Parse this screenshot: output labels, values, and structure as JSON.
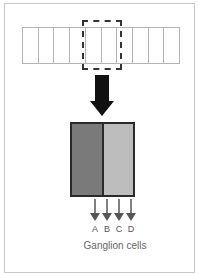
{
  "diagram": {
    "strip": {
      "cell_count": 10,
      "border_color": "#b4b4b4"
    },
    "selection_box": {
      "style": "dashed",
      "color": "#333333",
      "covers_cells": [
        4,
        5
      ]
    },
    "big_arrow": {
      "direction": "down",
      "color": "#111111"
    },
    "receptive_field": {
      "left_color": "#7a7a7a",
      "right_color": "#bdbdbd",
      "border_color": "#2a2a2a"
    },
    "outputs": [
      {
        "label": "A"
      },
      {
        "label": "B"
      },
      {
        "label": "C"
      },
      {
        "label": "D"
      }
    ],
    "caption": "Ganglion cells",
    "arrow_color": "#555555"
  }
}
